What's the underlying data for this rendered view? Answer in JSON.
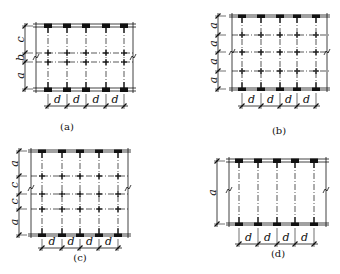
{
  "colors": {
    "ink": "#111111",
    "grid": "#222222",
    "beam": "#111111",
    "background": "#ffffff"
  },
  "panels": [
    {
      "id": "a",
      "caption": "(a)",
      "caption_pos": [
        67,
        130
      ],
      "frame": {
        "left": 36,
        "right": 133,
        "top": 24,
        "top2": 27,
        "bottom": 88,
        "bottom2": 91
      },
      "columns": [
        48,
        67,
        86,
        106,
        124
      ],
      "interior_rows": [
        53,
        62
      ],
      "vdim": {
        "x": 25,
        "ticks": [
          26,
          53,
          62,
          89
        ],
        "labels": [
          "c",
          "b",
          "a"
        ]
      },
      "hdim": {
        "y": 106,
        "label": "d"
      },
      "break_marks": [
        [
          36,
          57
        ],
        [
          133,
          57
        ]
      ]
    },
    {
      "id": "b",
      "caption": "(b)",
      "caption_pos": [
        279,
        134
      ],
      "frame": {
        "left": 232,
        "right": 327,
        "top": 15,
        "top2": 17,
        "bottom": 88,
        "bottom2": 90
      },
      "columns": [
        242,
        261,
        280,
        297,
        316
      ],
      "interior_rows": [
        35,
        52,
        71
      ],
      "vdim": {
        "x": 218,
        "ticks": [
          16,
          35,
          52,
          71,
          89
        ],
        "labels": [
          "a",
          "a",
          "a",
          "a"
        ]
      },
      "hdim": {
        "y": 106,
        "label": "d"
      },
      "break_marks": [
        [
          232,
          52
        ],
        [
          327,
          52
        ]
      ]
    },
    {
      "id": "c",
      "caption": "(c)",
      "caption_pos": [
        80,
        261
      ],
      "frame": {
        "left": 31,
        "right": 128,
        "top": 150,
        "top2": 152,
        "bottom": 234,
        "bottom2": 236
      },
      "columns": [
        42,
        62,
        80,
        99,
        118
      ],
      "interior_rows": [
        176,
        194,
        209
      ],
      "vdim": {
        "x": 19,
        "ticks": [
          151,
          176,
          194,
          209,
          235
        ],
        "labels": [
          "a",
          "c",
          "c",
          "a"
        ]
      },
      "hdim": {
        "y": 248,
        "label": "d"
      },
      "break_marks": [
        [
          31,
          188
        ],
        [
          128,
          188
        ]
      ]
    },
    {
      "id": "d",
      "caption": "(d)",
      "caption_pos": [
        278,
        257
      ],
      "frame": {
        "left": 229,
        "right": 326,
        "top": 159,
        "top2": 162,
        "bottom": 223,
        "bottom2": 225
      },
      "columns": [
        239,
        258,
        277,
        295,
        314
      ],
      "interior_rows": [],
      "vdim": {
        "x": 217,
        "ticks": [
          161,
          224
        ],
        "labels": [
          "a"
        ]
      },
      "hdim": {
        "y": 244,
        "label": "d"
      },
      "break_marks": [
        [
          229,
          190
        ],
        [
          326,
          190
        ]
      ]
    }
  ]
}
